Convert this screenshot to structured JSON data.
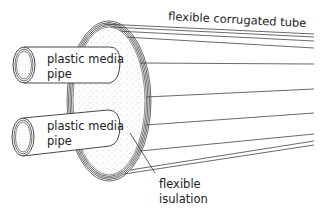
{
  "diagram": {
    "type": "cross-section illustration",
    "labels": {
      "tube": "flexible corrugated tube",
      "pipe_top_line1": "plastic media",
      "pipe_top_line2": "pipe",
      "pipe_bottom_line1": "plastic media",
      "pipe_bottom_line2": "pipe",
      "insulation_line1": "flexible",
      "insulation_line2": "isulation"
    },
    "colors": {
      "stroke": "#333333",
      "background": "#ffffff",
      "insulation_dots": "#777777"
    }
  }
}
